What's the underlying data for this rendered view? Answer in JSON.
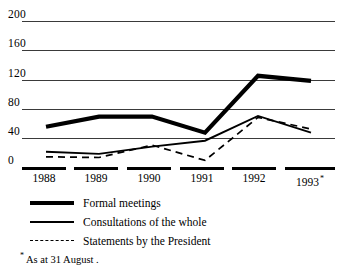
{
  "chart_data": {
    "type": "line",
    "title": "",
    "subtitle": "",
    "xlabel": "",
    "ylabel": "",
    "categories": [
      "1988",
      "1989",
      "1990",
      "1991",
      "1992",
      "1993"
    ],
    "x_tick_suffix_last": "*",
    "ylim": [
      0,
      200
    ],
    "y_ticks": [
      0,
      40,
      80,
      120,
      160,
      200
    ],
    "y_tick_labels": [
      "0",
      "40",
      "80",
      "120",
      "160",
      "200"
    ],
    "grid": true,
    "grid_axis": "y",
    "legend_position": "below",
    "series": [
      {
        "name": "Formal meetings",
        "style": "thick-solid",
        "color": "#000000",
        "values": [
          55,
          69,
          69,
          47,
          125,
          118
        ]
      },
      {
        "name": "Consultations of the whole",
        "style": "thin-solid",
        "color": "#000000",
        "values": [
          21,
          18,
          28,
          36,
          70,
          47
        ]
      },
      {
        "name": "Statements by the President",
        "style": "dashed",
        "color": "#000000",
        "values": [
          14,
          13,
          30,
          9,
          68,
          52
        ]
      }
    ],
    "annotations": [
      "* As at 31 August ."
    ]
  },
  "axis": {
    "y_labels": [
      "200",
      "160",
      "120",
      "80",
      "40",
      "0"
    ],
    "x_labels": [
      "1988",
      "1989",
      "1990",
      "1991",
      "1992",
      "1993"
    ],
    "x_last_marker": "*"
  },
  "legend": {
    "items": [
      {
        "label": "Formal meetings",
        "swatch": "thick-solid-line-swatch"
      },
      {
        "label": "Consultations of the whole",
        "swatch": "thin-solid-line-swatch"
      },
      {
        "label": "Statements by the President",
        "swatch": "dashed-line-swatch"
      }
    ]
  },
  "footnote": {
    "marker": "*",
    "text": "As at 31 August ."
  }
}
